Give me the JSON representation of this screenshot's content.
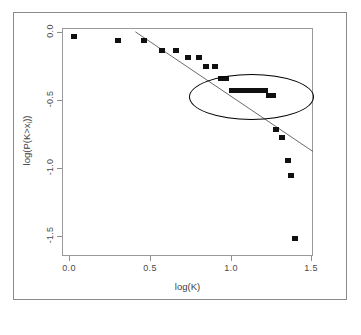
{
  "chart_data": {
    "type": "scatter",
    "title": "",
    "xlabel": "log(K)",
    "ylabel": "log(P(K>x_i))",
    "xlim": [
      -0.08,
      1.63
    ],
    "ylim": [
      -1.72,
      0.07
    ],
    "xticks": [
      0.0,
      0.5,
      1.0,
      1.5
    ],
    "xticklabels": [
      "0.0",
      "0.5",
      "1.0",
      "1.5"
    ],
    "yticks": [
      0.0,
      -0.5,
      -1.0,
      -1.5
    ],
    "yticklabels": [
      "0.0",
      "-0.5",
      "-1.0",
      "-1.5"
    ],
    "grid": false,
    "legend": null,
    "marker": "filled-square",
    "marker_color": "#101010",
    "points": [
      {
        "x": 0.0,
        "y": 0.0
      },
      {
        "x": 0.3,
        "y": -0.03
      },
      {
        "x": 0.48,
        "y": -0.03
      },
      {
        "x": 0.6,
        "y": -0.11
      },
      {
        "x": 0.7,
        "y": -0.11
      },
      {
        "x": 0.78,
        "y": -0.16
      },
      {
        "x": 0.85,
        "y": -0.16
      },
      {
        "x": 0.9,
        "y": -0.23
      },
      {
        "x": 0.96,
        "y": -0.23
      },
      {
        "x": 1.0,
        "y": -0.33
      },
      {
        "x": 1.04,
        "y": -0.33
      },
      {
        "x": 1.08,
        "y": -0.42
      },
      {
        "x": 1.12,
        "y": -0.42
      },
      {
        "x": 1.15,
        "y": -0.42
      },
      {
        "x": 1.18,
        "y": -0.42
      },
      {
        "x": 1.21,
        "y": -0.42
      },
      {
        "x": 1.24,
        "y": -0.42
      },
      {
        "x": 1.27,
        "y": -0.42
      },
      {
        "x": 1.3,
        "y": -0.42
      },
      {
        "x": 1.33,
        "y": -0.46
      },
      {
        "x": 1.36,
        "y": -0.46
      },
      {
        "x": 1.38,
        "y": -0.73
      },
      {
        "x": 1.42,
        "y": -0.79
      },
      {
        "x": 1.46,
        "y": -0.97
      },
      {
        "x": 1.48,
        "y": -1.09
      },
      {
        "x": 1.51,
        "y": -1.58
      }
    ],
    "fit_line": {
      "label": "linear-fit",
      "color": "#6b6b6b",
      "x_start": 0.42,
      "y_start": 0.04,
      "x_end": 1.63,
      "y_end": -0.9
    },
    "annotation_ellipse": {
      "label": "cluster-highlight",
      "center_x": 1.21,
      "center_y": -0.47,
      "width_x": 0.85,
      "height_y": 0.36,
      "color": "#000000"
    }
  }
}
